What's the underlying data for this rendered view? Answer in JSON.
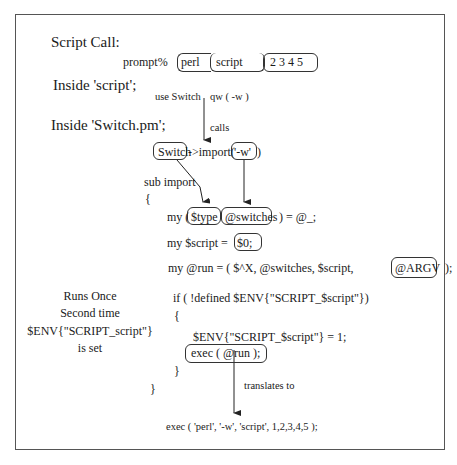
{
  "sections": {
    "script_call": "Script Call:",
    "inside_script": "Inside 'script';",
    "inside_switch_pm": "Inside 'Switch.pm';"
  },
  "prompt_line": {
    "prompt": "prompt%",
    "tokens": [
      "perl",
      "script",
      "2 3 4 5"
    ]
  },
  "use_line": {
    "use": "use Switch",
    "qw": "qw (  -w  )"
  },
  "labels": {
    "calls": "calls",
    "translates_to": "translates to"
  },
  "import_call": {
    "class": "Switch",
    "method": "->import(",
    "arg": "'-w'",
    "close": ")"
  },
  "sub_import": {
    "header": "sub import",
    "open_brace": "{",
    "close_brace": "}",
    "line1": {
      "prefix": "my (",
      "type": "$type",
      "switches": "@switches",
      "suffix": ") = @_;"
    },
    "line2": {
      "prefix": "my $script =",
      "value": "$0;"
    },
    "line3": {
      "prefix": "my @run = (   $^X,    @switches,   $script,",
      "argv": "@ARGV",
      "suffix": ");"
    },
    "if_line": "if ( !defined $ENV{\"SCRIPT_$script\"})",
    "if_open": "{",
    "env_set": "$ENV{\"SCRIPT_$script\"} = 1;",
    "exec_run": "exec (   @run    );",
    "if_close": "}"
  },
  "side_note": {
    "lines": [
      "Runs Once",
      "Second time",
      "$ENV{\"SCRIPT_script\"}",
      "is set"
    ]
  },
  "result": "exec ( 'perl', '-w', 'script', 1,2,3,4,5 );"
}
